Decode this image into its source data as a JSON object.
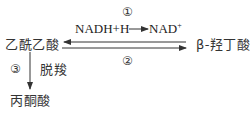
{
  "diagram": {
    "nodes": {
      "acetoacetate": "乙酰乙酸",
      "beta_hydroxybutyrate": "β-羟丁酸",
      "acetone": "丙酮酸"
    },
    "reactions": {
      "r1": {
        "label": "①",
        "cofactor_from": "NADH+H",
        "cofactor_to": "NAD",
        "cofactor_to_sup": "+",
        "direction": "乙酰乙酸 → β-羟丁酸 (arrow drawn pointing left toward 乙酰乙酸 on top line)"
      },
      "r2": {
        "label": "②",
        "direction": "乙酰乙酸 → β-羟丁酸"
      },
      "r3": {
        "label": "③",
        "process": "脱羧",
        "direction": "乙酰乙酸 → 丙酮酸"
      }
    },
    "colors": {
      "stroke": "#333333",
      "background": "#ffffff"
    }
  }
}
